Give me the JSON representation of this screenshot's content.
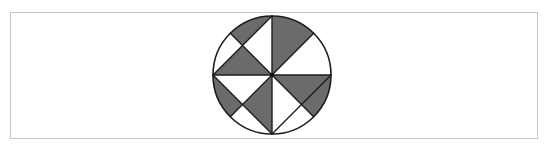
{
  "figure": {
    "circle": {
      "cx": 272,
      "cy": 75,
      "r": 59
    },
    "colors": {
      "background": "#ffffff",
      "frame_border": "#c6c6c6",
      "shade": "#6b6b6b",
      "line": "#1c1c1c"
    },
    "shaded_regions": [
      "top-left arc segment between 135° radius and chord",
      "top-left triangle (left point, chord/radius crossing, centre)",
      "top-right sector between vertical diameter and 45° radius",
      "bottom-right triangle (centre, right point, chord/radius crossing)",
      "bottom-right arc segment between right point and 315° radius",
      "bottom-left arc segment between left point and 225° radius",
      "bottom-left triangle (centre, chord/radius crossing, bottom point)"
    ]
  }
}
